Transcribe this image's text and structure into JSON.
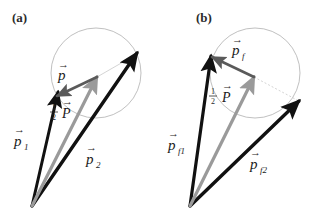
{
  "figure": {
    "background": "#ffffff",
    "width": 320,
    "height": 223
  },
  "colors": {
    "vector_black": "#111111",
    "vector_gray": "#9a9a9a",
    "vector_darkgray": "#5a5a5a",
    "circle_stroke": "#b9b9b9",
    "thin_line": "#cfcfcf",
    "text": "#1a1a1a"
  },
  "panels": [
    {
      "id": "panel-a",
      "label": "(a)",
      "label_pos": {
        "x": 12,
        "y": 22
      },
      "circle": {
        "cx": 96,
        "cy": 73,
        "r": 45
      },
      "origin": {
        "x": 32,
        "y": 206
      },
      "vectors": [
        {
          "name": "p1",
          "label": "p",
          "subscript": "1",
          "color": "vector_black",
          "width": 3.0,
          "from": {
            "x": 32,
            "y": 206
          },
          "to": {
            "x": 58,
            "y": 92
          },
          "label_pos": {
            "x": 14,
            "y": 143
          }
        },
        {
          "name": "p2",
          "label": "p",
          "subscript": "2",
          "color": "vector_black",
          "width": 3.4,
          "from": {
            "x": 32,
            "y": 206
          },
          "to": {
            "x": 137,
            "y": 53
          },
          "label_pos": {
            "x": 86,
            "y": 161
          }
        },
        {
          "name": "half-P",
          "label": "P",
          "subscript": "",
          "prefix": "1/2",
          "color": "vector_gray",
          "width": 3.2,
          "from": {
            "x": 32,
            "y": 206
          },
          "to": {
            "x": 97,
            "y": 77
          },
          "label_pos": {
            "x": 66,
            "y": 113
          }
        },
        {
          "name": "p-relative",
          "label": "p",
          "subscript": "",
          "color": "vector_darkgray",
          "width": 2.6,
          "from": {
            "x": 97,
            "y": 77
          },
          "to": {
            "x": 57,
            "y": 96
          },
          "label_pos": {
            "x": 58,
            "y": 77
          }
        }
      ],
      "thin_line": {
        "from": {
          "x": 97,
          "y": 77
        },
        "to": {
          "x": 137,
          "y": 54
        }
      }
    },
    {
      "id": "panel-b",
      "label": "(b)",
      "label_pos": {
        "x": 196,
        "y": 22
      },
      "circle": {
        "cx": 255,
        "cy": 73,
        "r": 45
      },
      "origin": {
        "x": 190,
        "y": 206
      },
      "vectors": [
        {
          "name": "pf1",
          "label": "p",
          "subscript": "f1",
          "color": "vector_black",
          "width": 3.2,
          "from": {
            "x": 190,
            "y": 206
          },
          "to": {
            "x": 211,
            "y": 56
          },
          "label_pos": {
            "x": 168,
            "y": 147
          }
        },
        {
          "name": "pf2",
          "label": "p",
          "subscript": "f2",
          "color": "vector_black",
          "width": 3.4,
          "from": {
            "x": 190,
            "y": 206
          },
          "to": {
            "x": 299,
            "y": 101
          },
          "label_pos": {
            "x": 250,
            "y": 166
          }
        },
        {
          "name": "half-P",
          "label": "P",
          "subscript": "",
          "prefix": "1/2",
          "color": "vector_gray",
          "width": 3.2,
          "from": {
            "x": 190,
            "y": 206
          },
          "to": {
            "x": 254,
            "y": 77
          },
          "label_pos": {
            "x": 222,
            "y": 100
          }
        },
        {
          "name": "pf-relative",
          "label": "p",
          "subscript": "f",
          "color": "vector_darkgray",
          "width": 2.6,
          "from": {
            "x": 254,
            "y": 77
          },
          "to": {
            "x": 212,
            "y": 57
          },
          "label_pos": {
            "x": 232,
            "y": 52
          }
        }
      ],
      "thin_line": {
        "from": {
          "x": 254,
          "y": 77
        },
        "to": {
          "x": 297,
          "y": 100
        }
      }
    }
  ],
  "glyphs": {
    "vector_arrow": "→",
    "fraction_numerator": "1",
    "fraction_denominator": "2"
  }
}
